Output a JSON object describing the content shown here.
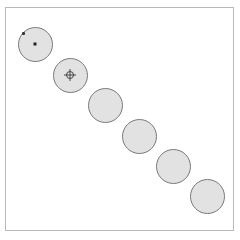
{
  "canvas": {
    "border_color": "#b8b8b8",
    "background": "#ffffff"
  },
  "discs": [
    {
      "cx": 35,
      "cy": 44,
      "marker": "center-dot",
      "handle": true
    },
    {
      "cx": 70,
      "cy": 75,
      "marker": "crosshair",
      "handle": false
    },
    {
      "cx": 105,
      "cy": 105,
      "marker": "none",
      "handle": false
    },
    {
      "cx": 139,
      "cy": 136,
      "marker": "none",
      "handle": false
    },
    {
      "cx": 173,
      "cy": 166,
      "marker": "none",
      "handle": false
    },
    {
      "cx": 207,
      "cy": 196,
      "marker": "none",
      "handle": false
    }
  ],
  "disc_style": {
    "fill": "#e2e2e2",
    "stroke": "#7a7a7a",
    "diameter": 35
  }
}
